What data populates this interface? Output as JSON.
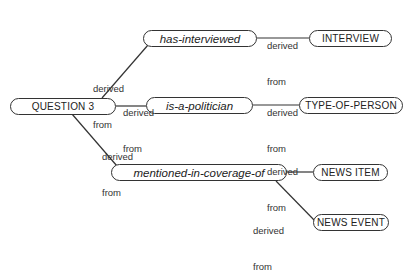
{
  "diagram": {
    "type": "concept-graph",
    "nodes": {
      "question3": {
        "label": "QUESTION 3",
        "kind": "concept"
      },
      "has_interviewed": {
        "label": "has-interviewed",
        "kind": "relation"
      },
      "interview": {
        "label": "INTERVIEW",
        "kind": "concept"
      },
      "is_a_politician": {
        "label": "is-a-politician",
        "kind": "relation"
      },
      "type_of_person": {
        "label": "TYPE-OF-PERSON",
        "kind": "concept"
      },
      "mentioned_in_coverage_of": {
        "label": "mentioned-in-coverage-of",
        "kind": "relation"
      },
      "news_item": {
        "label": "NEWS ITEM",
        "kind": "concept"
      },
      "news_event": {
        "label": "NEWS EVENT",
        "kind": "concept"
      }
    },
    "edges": [
      {
        "from": "question3",
        "to": "has_interviewed",
        "label_line1": "derived",
        "label_line2": "from"
      },
      {
        "from": "question3",
        "to": "is_a_politician",
        "label_line1": "derived",
        "label_line2": "from"
      },
      {
        "from": "question3",
        "to": "mentioned_in_coverage_of",
        "label_line1": "derived",
        "label_line2": "from"
      },
      {
        "from": "has_interviewed",
        "to": "interview",
        "label_line1": "derived",
        "label_line2": "from"
      },
      {
        "from": "is_a_politician",
        "to": "type_of_person",
        "label_line1": "derived",
        "label_line2": "from"
      },
      {
        "from": "mentioned_in_coverage_of",
        "to": "news_item",
        "label_line1": "derived",
        "label_line2": "from"
      },
      {
        "from": "mentioned_in_coverage_of",
        "to": "news_event",
        "label_line1": "derived",
        "label_line2": "from"
      }
    ]
  }
}
